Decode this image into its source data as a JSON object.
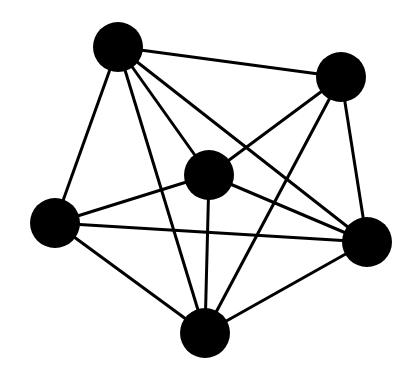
{
  "diagram": {
    "type": "graph",
    "background": "#ffffff",
    "node_color": "#000000",
    "edge_color": "#000000",
    "edge_width": 3,
    "node_radius": 25,
    "nodes": [
      {
        "id": "top-left",
        "x": 118,
        "y": 47
      },
      {
        "id": "top-right",
        "x": 341,
        "y": 77
      },
      {
        "id": "center",
        "x": 209,
        "y": 175
      },
      {
        "id": "left",
        "x": 55,
        "y": 223
      },
      {
        "id": "right",
        "x": 367,
        "y": 242
      },
      {
        "id": "bottom",
        "x": 205,
        "y": 333
      }
    ],
    "edges": [
      [
        "top-left",
        "top-right"
      ],
      [
        "top-left",
        "center"
      ],
      [
        "top-left",
        "left"
      ],
      [
        "top-left",
        "bottom"
      ],
      [
        "top-left",
        "right"
      ],
      [
        "top-right",
        "center"
      ],
      [
        "top-right",
        "bottom"
      ],
      [
        "top-right",
        "right"
      ],
      [
        "center",
        "left"
      ],
      [
        "center",
        "right"
      ],
      [
        "center",
        "bottom"
      ],
      [
        "left",
        "right"
      ],
      [
        "left",
        "bottom"
      ],
      [
        "bottom",
        "right"
      ]
    ]
  }
}
